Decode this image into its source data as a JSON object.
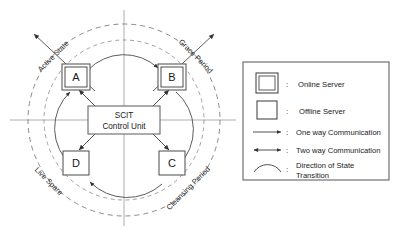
{
  "diagram": {
    "control_unit": {
      "line1": "SCIT",
      "line2": "Control Unit"
    },
    "servers": [
      {
        "id": "A",
        "label": "A",
        "state": "online",
        "quadrant": "Active State"
      },
      {
        "id": "B",
        "label": "B",
        "state": "online",
        "quadrant": "Grace Period"
      },
      {
        "id": "C",
        "label": "C",
        "state": "offline",
        "quadrant": "Cleansing Period"
      },
      {
        "id": "D",
        "label": "D",
        "state": "offline",
        "quadrant": "Live Spare"
      }
    ],
    "quadrant_labels": {
      "top_left": "Active State",
      "top_right": "Grace Period",
      "bottom_right": "Cleansing Period",
      "bottom_left": "Live Spare"
    },
    "rotation_order": [
      "A",
      "B",
      "C",
      "D"
    ],
    "colors": {
      "stroke": "#555555",
      "dashed": "#777777",
      "axis": "#888888",
      "text": "#1a1a1a",
      "background": "#ffffff"
    }
  },
  "legend": {
    "items": [
      {
        "glyph": "double-square-icon",
        "colon": ":",
        "label": "Online Server"
      },
      {
        "glyph": "single-square-icon",
        "colon": ":",
        "label": "Offline Server"
      },
      {
        "glyph": "one-way-arrow-icon",
        "colon": ":",
        "label": "One way Communication"
      },
      {
        "glyph": "two-way-arrow-icon",
        "colon": ":",
        "label": "Two way Communication"
      },
      {
        "glyph": "arc-icon",
        "colon": ":",
        "label": "Direction of State",
        "label2": "Transition"
      }
    ]
  }
}
